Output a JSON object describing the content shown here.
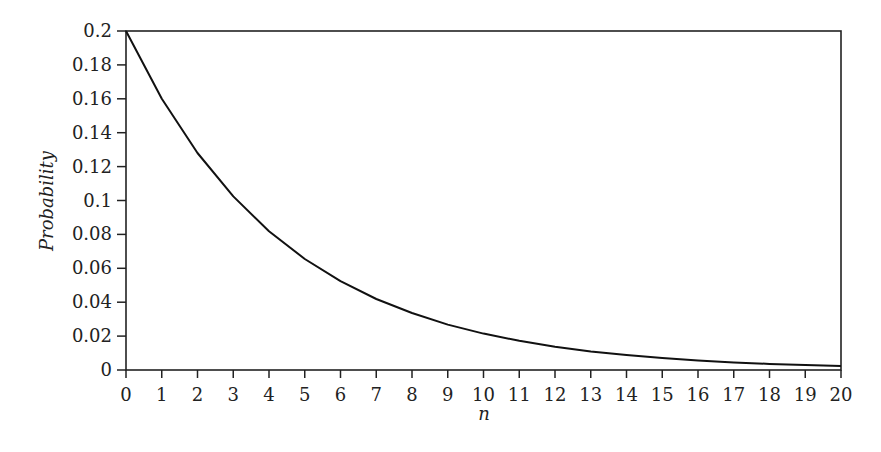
{
  "chart_data": {
    "type": "line",
    "title": "",
    "xlabel": "n",
    "ylabel": "Probability",
    "x": [
      0,
      1,
      2,
      3,
      4,
      5,
      6,
      7,
      8,
      9,
      10,
      11,
      12,
      13,
      14,
      15,
      16,
      17,
      18,
      19,
      20
    ],
    "series": [
      {
        "name": "P(n)",
        "values": [
          0.2,
          0.16,
          0.128,
          0.1024,
          0.0819,
          0.0655,
          0.0524,
          0.0419,
          0.0336,
          0.0268,
          0.0215,
          0.0172,
          0.0137,
          0.011,
          0.0088,
          0.007,
          0.0056,
          0.0045,
          0.0036,
          0.0029,
          0.0023
        ]
      }
    ],
    "xlim": [
      0,
      20
    ],
    "ylim": [
      0,
      0.2
    ],
    "xticks": [
      "0",
      "1",
      "2",
      "3",
      "4",
      "5",
      "6",
      "7",
      "8",
      "9",
      "10",
      "11",
      "12",
      "13",
      "14",
      "15",
      "16",
      "17",
      "18",
      "19",
      "20"
    ],
    "yticks": [
      "0",
      "0.02",
      "0.04",
      "0.06",
      "0.08",
      "0.1",
      "0.12",
      "0.14",
      "0.16",
      "0.18",
      "0.2"
    ],
    "grid": false,
    "legend": null,
    "line_color": "#111111"
  }
}
